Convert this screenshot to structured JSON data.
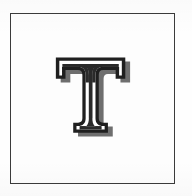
{
  "image": {
    "type": "scanned-letter-plate",
    "background_color": "#fefefe",
    "description": "Decorative outlined capital letter centered within a thin rectangular frame"
  },
  "frame": {
    "name": "plate-border",
    "stroke_color": "#3b3b3b",
    "stroke_width_px": 1,
    "fill_color": "#fdfdfd",
    "left_px": 10,
    "top_px": 13,
    "width_px": 165,
    "height_px": 171
  },
  "glyph": {
    "character": "T",
    "style": "inline outlined serif with drop shadow",
    "outline_color": "#1f1f1f",
    "inline_color": "#ffffff",
    "fill_color": "#2a2a2a",
    "shadow_color": "#6e6e6e",
    "left_px": 56,
    "top_px": 64,
    "width_px": 81,
    "height_px": 84
  }
}
